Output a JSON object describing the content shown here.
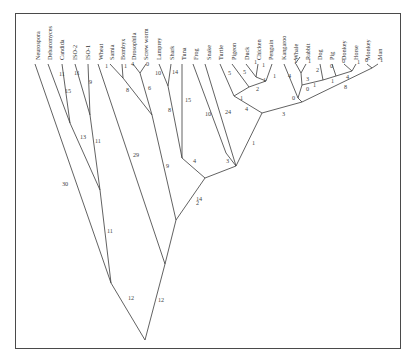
{
  "figure": {
    "type": "phylogenetic-tree",
    "frame_color": "#4a4a4a",
    "line_color": "#3a3a3a"
  },
  "taxa": [
    {
      "id": "neurospora",
      "label": "Neurospora",
      "x": 38,
      "y": 62
    },
    {
      "id": "debaromyces",
      "label": "Debaromyces",
      "x": 50,
      "y": 62
    },
    {
      "id": "candida",
      "label": "Candida",
      "x": 62,
      "y": 62
    },
    {
      "id": "iso2",
      "label": "ISO-2",
      "x": 75,
      "y": 62
    },
    {
      "id": "iso1",
      "label": "ISO-1",
      "x": 88,
      "y": 62
    },
    {
      "id": "wheat",
      "label": "Wheat",
      "x": 101,
      "y": 62
    },
    {
      "id": "samia",
      "label": "Samia",
      "x": 112,
      "y": 62
    },
    {
      "id": "bombyx",
      "label": "Bombyx",
      "x": 123,
      "y": 62
    },
    {
      "id": "drosophila",
      "label": "Drosophila",
      "x": 134,
      "y": 62
    },
    {
      "id": "screwworm",
      "label": "Screw worm",
      "x": 146,
      "y": 62
    },
    {
      "id": "lamprey",
      "label": "Lamprey",
      "x": 159,
      "y": 62
    },
    {
      "id": "shark",
      "label": "Shark",
      "x": 172,
      "y": 62
    },
    {
      "id": "tuna",
      "label": "Tuna",
      "x": 184,
      "y": 62
    },
    {
      "id": "frog",
      "label": "Frog",
      "x": 196,
      "y": 62
    },
    {
      "id": "snake",
      "label": "Snake",
      "x": 209,
      "y": 62
    },
    {
      "id": "turtle",
      "label": "Turtle",
      "x": 221,
      "y": 62
    },
    {
      "id": "pigeon",
      "label": "Pigeon",
      "x": 234,
      "y": 62
    },
    {
      "id": "duck",
      "label": "Duck",
      "x": 247,
      "y": 62
    },
    {
      "id": "chicken",
      "label": "Chicken",
      "x": 259,
      "y": 62
    },
    {
      "id": "penguin",
      "label": "Penguin",
      "x": 271,
      "y": 62
    },
    {
      "id": "kangaroo",
      "label": "Kangaroo",
      "x": 284,
      "y": 62
    },
    {
      "id": "whale",
      "label": "Whale",
      "x": 296,
      "y": 62
    },
    {
      "id": "rabbit",
      "label": "Rabbit",
      "x": 308,
      "y": 62
    },
    {
      "id": "dog",
      "label": "Dog",
      "x": 320,
      "y": 62
    },
    {
      "id": "pig",
      "label": "Pig",
      "x": 332,
      "y": 62
    },
    {
      "id": "donkey",
      "label": "Donkey",
      "x": 344,
      "y": 62
    },
    {
      "id": "horse",
      "label": "Horse",
      "x": 356,
      "y": 62
    },
    {
      "id": "monkey",
      "label": "Monkey",
      "x": 368,
      "y": 62
    },
    {
      "id": "man",
      "label": "Man",
      "x": 380,
      "y": 62
    }
  ],
  "branches": [
    {
      "x1": 35,
      "y1": 64,
      "x2": 111,
      "y2": 283,
      "label": "30",
      "lx": 62,
      "ly": 186
    },
    {
      "x1": 48,
      "y1": 64,
      "x2": 70,
      "y2": 123,
      "label": "15",
      "lx": 65,
      "ly": 93
    },
    {
      "x1": 62,
      "y1": 64,
      "x2": 70,
      "y2": 123,
      "label": "11",
      "lx": 59,
      "ly": 76
    },
    {
      "x1": 70,
      "y1": 123,
      "x2": 100,
      "y2": 190,
      "label": "13",
      "lx": 80,
      "ly": 139
    },
    {
      "x1": 75,
      "y1": 64,
      "x2": 90,
      "y2": 115,
      "label": "11",
      "lx": 74,
      "ly": 75
    },
    {
      "x1": 88,
      "y1": 64,
      "x2": 90,
      "y2": 115,
      "label": "9",
      "lx": 89,
      "ly": 84
    },
    {
      "x1": 90,
      "y1": 115,
      "x2": 100,
      "y2": 190,
      "label": "11",
      "lx": 95,
      "ly": 143
    },
    {
      "x1": 100,
      "y1": 190,
      "x2": 111,
      "y2": 283,
      "label": "11",
      "lx": 107,
      "ly": 233
    },
    {
      "x1": 111,
      "y1": 283,
      "x2": 145,
      "y2": 340,
      "label": "12",
      "lx": 128,
      "ly": 300
    },
    {
      "x1": 98,
      "y1": 64,
      "x2": 165,
      "y2": 264,
      "label": "29",
      "lx": 133,
      "ly": 157
    },
    {
      "x1": 110,
      "y1": 64,
      "x2": 123,
      "y2": 78,
      "label": "1",
      "lx": 105,
      "ly": 68
    },
    {
      "x1": 122,
      "y1": 64,
      "x2": 123,
      "y2": 78,
      "label": "1",
      "lx": 124,
      "ly": 68
    },
    {
      "x1": 123,
      "y1": 78,
      "x2": 152,
      "y2": 115,
      "label": "8",
      "lx": 126,
      "ly": 92
    },
    {
      "x1": 133,
      "y1": 64,
      "x2": 140,
      "y2": 73,
      "label": "4",
      "lx": 131,
      "ly": 66
    },
    {
      "x1": 146,
      "y1": 64,
      "x2": 140,
      "y2": 73,
      "label": "0",
      "lx": 146,
      "ly": 66
    },
    {
      "x1": 140,
      "y1": 73,
      "x2": 152,
      "y2": 115,
      "label": "6",
      "lx": 148,
      "ly": 90
    },
    {
      "x1": 152,
      "y1": 115,
      "x2": 176,
      "y2": 220,
      "label": "9",
      "lx": 166,
      "ly": 168
    },
    {
      "x1": 159,
      "y1": 64,
      "x2": 168,
      "y2": 86,
      "label": "10",
      "lx": 155,
      "ly": 75
    },
    {
      "x1": 171,
      "y1": 64,
      "x2": 168,
      "y2": 86,
      "label": "14",
      "lx": 172,
      "ly": 74
    },
    {
      "x1": 168,
      "y1": 86,
      "x2": 182,
      "y2": 158,
      "label": "8",
      "lx": 168,
      "ly": 112
    },
    {
      "x1": 182,
      "y1": 64,
      "x2": 182,
      "y2": 158,
      "label": "15",
      "lx": 185,
      "ly": 102
    },
    {
      "x1": 182,
      "y1": 158,
      "x2": 205,
      "y2": 178,
      "label": "4",
      "lx": 193,
      "ly": 163
    },
    {
      "x1": 205,
      "y1": 178,
      "x2": 176,
      "y2": 220,
      "label": "2",
      "lx": 196,
      "ly": 205
    },
    {
      "x1": 176,
      "y1": 220,
      "x2": 165,
      "y2": 264,
      "label": "14",
      "lx": 196,
      "ly": 201
    },
    {
      "x1": 165,
      "y1": 264,
      "x2": 145,
      "y2": 340,
      "label": "12",
      "lx": 158,
      "ly": 302
    },
    {
      "x1": 193,
      "y1": 64,
      "x2": 226,
      "y2": 153,
      "label": "10",
      "lx": 205,
      "ly": 116
    },
    {
      "x1": 205,
      "y1": 64,
      "x2": 236,
      "y2": 166,
      "label": "24",
      "lx": 225,
      "ly": 114
    },
    {
      "x1": 226,
      "y1": 153,
      "x2": 236,
      "y2": 166,
      "label": "3",
      "lx": 226,
      "ly": 163
    },
    {
      "x1": 236,
      "y1": 166,
      "x2": 205,
      "y2": 178,
      "label": "",
      "lx": 0,
      "ly": 0
    },
    {
      "x1": 220,
      "y1": 64,
      "x2": 234,
      "y2": 96,
      "label": "5",
      "lx": 228,
      "ly": 75
    },
    {
      "x1": 232,
      "y1": 64,
      "x2": 249,
      "y2": 87,
      "label": "5",
      "lx": 243,
      "ly": 74
    },
    {
      "x1": 246,
      "y1": 64,
      "x2": 256,
      "y2": 77,
      "label": "1",
      "lx": 254,
      "ly": 64
    },
    {
      "x1": 258,
      "y1": 64,
      "x2": 256,
      "y2": 77,
      "label": "1",
      "lx": 262,
      "ly": 67
    },
    {
      "x1": 256,
      "y1": 77,
      "x2": 266,
      "y2": 81,
      "label": "",
      "lx": 0,
      "ly": 0
    },
    {
      "x1": 272,
      "y1": 64,
      "x2": 266,
      "y2": 81,
      "label": "1",
      "lx": 273,
      "ly": 78
    },
    {
      "x1": 266,
      "y1": 81,
      "x2": 249,
      "y2": 87,
      "label": "1",
      "lx": 263,
      "ly": 82
    },
    {
      "x1": 249,
      "y1": 87,
      "x2": 234,
      "y2": 96,
      "label": "2",
      "lx": 256,
      "ly": 91
    },
    {
      "x1": 234,
      "y1": 96,
      "x2": 262,
      "y2": 113,
      "label": "4",
      "lx": 245,
      "ly": 111
    },
    {
      "x1": 234,
      "y1": 96,
      "x2": 234,
      "y2": 96,
      "label": "1",
      "lx": 240,
      "ly": 100
    },
    {
      "x1": 262,
      "y1": 113,
      "x2": 236,
      "y2": 166,
      "label": "1",
      "lx": 252,
      "ly": 145
    },
    {
      "x1": 262,
      "y1": 113,
      "x2": 302,
      "y2": 102,
      "label": "3",
      "lx": 282,
      "ly": 116
    },
    {
      "x1": 284,
      "y1": 64,
      "x2": 298,
      "y2": 98,
      "label": "4",
      "lx": 288,
      "ly": 78
    },
    {
      "x1": 298,
      "y1": 98,
      "x2": 302,
      "y2": 102,
      "label": "0",
      "lx": 292,
      "ly": 100
    },
    {
      "x1": 295,
      "y1": 64,
      "x2": 300,
      "y2": 57,
      "label": "",
      "lx": 0,
      "ly": 0
    },
    {
      "x1": 296,
      "y1": 64,
      "x2": 301,
      "y2": 73,
      "label": "1",
      "lx": 294,
      "ly": 63
    },
    {
      "x1": 306,
      "y1": 64,
      "x2": 301,
      "y2": 73,
      "label": "1",
      "lx": 308,
      "ly": 63
    },
    {
      "x1": 301,
      "y1": 73,
      "x2": 302,
      "y2": 85,
      "label": "3",
      "lx": 306,
      "ly": 81
    },
    {
      "x1": 302,
      "y1": 85,
      "x2": 298,
      "y2": 98,
      "label": "0",
      "lx": 306,
      "ly": 91
    },
    {
      "x1": 302,
      "y1": 85,
      "x2": 323,
      "y2": 80,
      "label": "1",
      "lx": 313,
      "ly": 87
    },
    {
      "x1": 320,
      "y1": 64,
      "x2": 323,
      "y2": 80,
      "label": "2",
      "lx": 316,
      "ly": 72
    },
    {
      "x1": 323,
      "y1": 80,
      "x2": 336,
      "y2": 76,
      "label": "1",
      "lx": 331,
      "ly": 83
    },
    {
      "x1": 332,
      "y1": 64,
      "x2": 336,
      "y2": 76,
      "label": "0",
      "lx": 330,
      "ly": 68
    },
    {
      "x1": 336,
      "y1": 76,
      "x2": 352,
      "y2": 71,
      "label": "4",
      "lx": 346,
      "ly": 79
    },
    {
      "x1": 344,
      "y1": 64,
      "x2": 352,
      "y2": 71,
      "label": "0",
      "lx": 342,
      "ly": 63
    },
    {
      "x1": 356,
      "y1": 64,
      "x2": 352,
      "y2": 71,
      "label": "1",
      "lx": 357,
      "ly": 64
    },
    {
      "x1": 302,
      "y1": 102,
      "x2": 372,
      "y2": 68,
      "label": "8",
      "lx": 344,
      "ly": 89
    },
    {
      "x1": 367,
      "y1": 64,
      "x2": 372,
      "y2": 68,
      "label": "0",
      "lx": 365,
      "ly": 62
    },
    {
      "x1": 378,
      "y1": 64,
      "x2": 372,
      "y2": 68,
      "label": "1",
      "lx": 380,
      "ly": 62
    }
  ]
}
